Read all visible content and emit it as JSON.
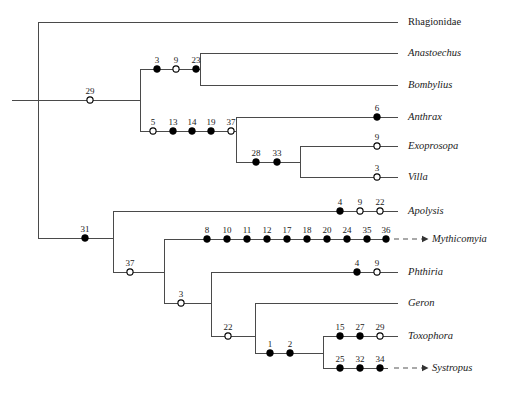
{
  "figure": {
    "kind": "cladogram",
    "width": 516,
    "height": 394,
    "line_color": "#4a4a4a",
    "node_fill_color": "#000000",
    "node_open_color": "#ffffff",
    "text_color": "#1a1a1a"
  },
  "taxa": [
    {
      "id": "rhagionidae",
      "label": "Rhagionidae",
      "italic": false,
      "y": 22,
      "tip_x": 398,
      "label_x": 408,
      "ghost_arrow": false
    },
    {
      "id": "anastoechus",
      "label": "Anastoechus",
      "italic": true,
      "y": 53,
      "tip_x": 398,
      "label_x": 408,
      "ghost_arrow": false
    },
    {
      "id": "bombylius",
      "label": "Bombylius",
      "italic": true,
      "y": 85,
      "tip_x": 398,
      "label_x": 408,
      "ghost_arrow": false
    },
    {
      "id": "anthrax",
      "label": "Anthrax",
      "italic": true,
      "y": 117,
      "tip_x": 398,
      "label_x": 408,
      "ghost_arrow": false
    },
    {
      "id": "exoprosopa",
      "label": "Exoprosopa",
      "italic": true,
      "y": 146,
      "tip_x": 398,
      "label_x": 408,
      "ghost_arrow": false
    },
    {
      "id": "villa",
      "label": "Villa",
      "italic": true,
      "y": 177,
      "tip_x": 398,
      "label_x": 408,
      "ghost_arrow": false
    },
    {
      "id": "apolysis",
      "label": "Apolysis",
      "italic": true,
      "y": 211,
      "tip_x": 398,
      "label_x": 408,
      "ghost_arrow": false
    },
    {
      "id": "mythicomyia",
      "label": "Mythicomyia",
      "italic": true,
      "y": 239,
      "tip_x": 388,
      "label_x": 432,
      "ghost_arrow": true
    },
    {
      "id": "phthiria",
      "label": "Phthiria",
      "italic": true,
      "y": 272,
      "tip_x": 398,
      "label_x": 408,
      "ghost_arrow": false
    },
    {
      "id": "geron",
      "label": "Geron",
      "italic": true,
      "y": 303,
      "tip_x": 398,
      "label_x": 408,
      "ghost_arrow": false
    },
    {
      "id": "toxophora",
      "label": "Toxophora",
      "italic": true,
      "y": 336,
      "tip_x": 398,
      "label_x": 408,
      "ghost_arrow": false
    },
    {
      "id": "systropus",
      "label": "Systropus",
      "italic": true,
      "y": 368,
      "tip_x": 388,
      "label_x": 432,
      "ghost_arrow": true
    }
  ],
  "horizontal_branches": [
    {
      "id": "branch-root-stem",
      "x1": 12,
      "x2": 38,
      "y": 100
    },
    {
      "id": "branch-rhagionidae",
      "x1": 38,
      "x2": 398,
      "y": 22
    },
    {
      "id": "branch-node29",
      "x1": 38,
      "x2": 140,
      "y": 100
    },
    {
      "id": "branch-bombyliinae-stem",
      "x1": 140,
      "x2": 200,
      "y": 69
    },
    {
      "id": "branch-anastoechus",
      "x1": 200,
      "x2": 398,
      "y": 53
    },
    {
      "id": "branch-bombylius",
      "x1": 200,
      "x2": 398,
      "y": 85
    },
    {
      "id": "branch-node5-chain",
      "x1": 140,
      "x2": 236,
      "y": 131
    },
    {
      "id": "branch-anthrax",
      "x1": 236,
      "x2": 398,
      "y": 117
    },
    {
      "id": "branch-node2833",
      "x1": 236,
      "x2": 300,
      "y": 162
    },
    {
      "id": "branch-exoprosopa",
      "x1": 300,
      "x2": 398,
      "y": 146
    },
    {
      "id": "branch-villa",
      "x1": 300,
      "x2": 398,
      "y": 177
    },
    {
      "id": "branch-node31",
      "x1": 38,
      "x2": 113,
      "y": 238
    },
    {
      "id": "branch-apolysis",
      "x1": 113,
      "x2": 398,
      "y": 211
    },
    {
      "id": "branch-node37",
      "x1": 113,
      "x2": 164,
      "y": 272
    },
    {
      "id": "branch-mythicomyia",
      "x1": 164,
      "x2": 388,
      "y": 239
    },
    {
      "id": "branch-node3",
      "x1": 164,
      "x2": 211,
      "y": 303
    },
    {
      "id": "branch-phthiria",
      "x1": 211,
      "x2": 398,
      "y": 272
    },
    {
      "id": "branch-node22",
      "x1": 211,
      "x2": 255,
      "y": 336
    },
    {
      "id": "branch-geron",
      "x1": 255,
      "x2": 398,
      "y": 303
    },
    {
      "id": "branch-node12",
      "x1": 255,
      "x2": 323,
      "y": 353
    },
    {
      "id": "branch-toxophora",
      "x1": 323,
      "x2": 398,
      "y": 336
    },
    {
      "id": "branch-systropus",
      "x1": 323,
      "x2": 388,
      "y": 368
    }
  ],
  "vertical_branches": [
    {
      "id": "vert-root",
      "x": 38,
      "y1": 22,
      "y2": 238
    },
    {
      "id": "vert-node29",
      "x": 140,
      "y1": 69,
      "y2": 131
    },
    {
      "id": "vert-bombyliinae",
      "x": 200,
      "y1": 53,
      "y2": 85
    },
    {
      "id": "vert-anthracinae",
      "x": 236,
      "y1": 117,
      "y2": 162
    },
    {
      "id": "vert-exopro-villa",
      "x": 300,
      "y1": 146,
      "y2": 177
    },
    {
      "id": "vert-node31",
      "x": 113,
      "y1": 211,
      "y2": 272
    },
    {
      "id": "vert-node37",
      "x": 164,
      "y1": 239,
      "y2": 303
    },
    {
      "id": "vert-node3",
      "x": 211,
      "y1": 272,
      "y2": 336
    },
    {
      "id": "vert-node22",
      "x": 255,
      "y1": 303,
      "y2": 353
    },
    {
      "id": "vert-toxo-systro",
      "x": 323,
      "y1": 336,
      "y2": 368
    }
  ],
  "character_nodes": [
    {
      "id": "char-29",
      "label": "29",
      "x": 90,
      "y": 100,
      "filled": false
    },
    {
      "id": "char-3a",
      "label": "3",
      "x": 157,
      "y": 69,
      "filled": true
    },
    {
      "id": "char-9a",
      "label": "9",
      "x": 176,
      "y": 69,
      "filled": false
    },
    {
      "id": "char-23",
      "label": "23",
      "x": 196,
      "y": 69,
      "filled": true
    },
    {
      "id": "char-5",
      "label": "5",
      "x": 153,
      "y": 131,
      "filled": false
    },
    {
      "id": "char-13",
      "label": "13",
      "x": 173,
      "y": 131,
      "filled": true
    },
    {
      "id": "char-14",
      "label": "14",
      "x": 192,
      "y": 131,
      "filled": true
    },
    {
      "id": "char-19",
      "label": "19",
      "x": 211,
      "y": 131,
      "filled": true
    },
    {
      "id": "char-37a",
      "label": "37",
      "x": 231,
      "y": 131,
      "filled": false
    },
    {
      "id": "char-6",
      "label": "6",
      "x": 377,
      "y": 117,
      "filled": true
    },
    {
      "id": "char-28",
      "label": "28",
      "x": 256,
      "y": 162,
      "filled": true
    },
    {
      "id": "char-33",
      "label": "33",
      "x": 277,
      "y": 162,
      "filled": true
    },
    {
      "id": "char-9b",
      "label": "9",
      "x": 377,
      "y": 146,
      "filled": false
    },
    {
      "id": "char-3b",
      "label": "3",
      "x": 377,
      "y": 177,
      "filled": false
    },
    {
      "id": "char-31",
      "label": "31",
      "x": 85,
      "y": 238,
      "filled": true
    },
    {
      "id": "char-4a",
      "label": "4",
      "x": 340,
      "y": 211,
      "filled": true
    },
    {
      "id": "char-9c",
      "label": "9",
      "x": 360,
      "y": 211,
      "filled": false
    },
    {
      "id": "char-22a",
      "label": "22",
      "x": 380,
      "y": 211,
      "filled": false
    },
    {
      "id": "char-8",
      "label": "8",
      "x": 207,
      "y": 239,
      "filled": true
    },
    {
      "id": "char-10",
      "label": "10",
      "x": 227,
      "y": 239,
      "filled": true
    },
    {
      "id": "char-11",
      "label": "11",
      "x": 247,
      "y": 239,
      "filled": true
    },
    {
      "id": "char-12",
      "label": "12",
      "x": 267,
      "y": 239,
      "filled": true
    },
    {
      "id": "char-17",
      "label": "17",
      "x": 287,
      "y": 239,
      "filled": true
    },
    {
      "id": "char-18",
      "label": "18",
      "x": 307,
      "y": 239,
      "filled": true
    },
    {
      "id": "char-20",
      "label": "20",
      "x": 327,
      "y": 239,
      "filled": true
    },
    {
      "id": "char-24",
      "label": "24",
      "x": 347,
      "y": 239,
      "filled": true
    },
    {
      "id": "char-35",
      "label": "35",
      "x": 367,
      "y": 239,
      "filled": true
    },
    {
      "id": "char-36",
      "label": "36",
      "x": 386,
      "y": 239,
      "filled": true
    },
    {
      "id": "char-37b",
      "label": "37",
      "x": 130,
      "y": 272,
      "filled": false
    },
    {
      "id": "char-4b",
      "label": "4",
      "x": 357,
      "y": 272,
      "filled": true
    },
    {
      "id": "char-9d",
      "label": "9",
      "x": 377,
      "y": 272,
      "filled": false
    },
    {
      "id": "char-3c",
      "label": "3",
      "x": 181,
      "y": 303,
      "filled": false
    },
    {
      "id": "char-22b",
      "label": "22",
      "x": 228,
      "y": 336,
      "filled": false
    },
    {
      "id": "char-1",
      "label": "1",
      "x": 270,
      "y": 353,
      "filled": true
    },
    {
      "id": "char-2",
      "label": "2",
      "x": 290,
      "y": 353,
      "filled": true
    },
    {
      "id": "char-15",
      "label": "15",
      "x": 340,
      "y": 336,
      "filled": true
    },
    {
      "id": "char-27",
      "label": "27",
      "x": 360,
      "y": 336,
      "filled": true
    },
    {
      "id": "char-29b",
      "label": "29",
      "x": 380,
      "y": 336,
      "filled": false
    },
    {
      "id": "char-25",
      "label": "25",
      "x": 340,
      "y": 368,
      "filled": true
    },
    {
      "id": "char-32",
      "label": "32",
      "x": 360,
      "y": 368,
      "filled": true
    },
    {
      "id": "char-34",
      "label": "34",
      "x": 380,
      "y": 368,
      "filled": true
    }
  ],
  "legend": {
    "filled_meaning": "unique / unreversed change",
    "open_meaning": "homoplastic change"
  }
}
